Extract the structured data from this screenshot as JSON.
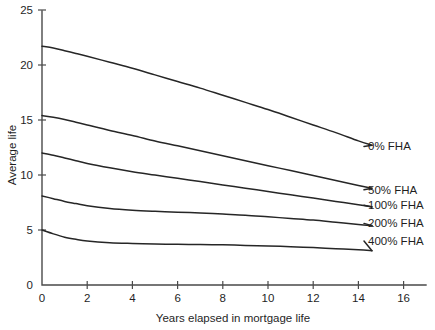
{
  "chart_data": {
    "type": "line",
    "title": "",
    "xlabel": "Years elapsed in mortgage life",
    "ylabel": "Average life",
    "xlim": [
      0,
      17
    ],
    "ylim": [
      0,
      25
    ],
    "xticks": [
      0,
      2,
      4,
      6,
      8,
      10,
      12,
      14,
      16
    ],
    "yticks": [
      0,
      5,
      10,
      15,
      20,
      25
    ],
    "xtick_labels": [
      "0",
      "2",
      "4",
      "6",
      "8",
      "10",
      "12",
      "14",
      "16"
    ],
    "ytick_labels": [
      "0",
      "5",
      "10",
      "15",
      "20",
      "25"
    ],
    "grid": false,
    "legend_position": "right-inline-labels",
    "line_color": "#262626",
    "axis_color": "#4a4a4a",
    "background": "#ffffff",
    "x": [
      0,
      0.5,
      1,
      1.5,
      2,
      3,
      4,
      5,
      6,
      7,
      8,
      9,
      10,
      11,
      12,
      13,
      14,
      14.6
    ],
    "series": [
      {
        "name": "0% FHA",
        "label": "0% FHA",
        "values": [
          21.7,
          21.55,
          21.3,
          21.05,
          20.8,
          20.25,
          19.7,
          19.1,
          18.5,
          17.9,
          17.25,
          16.6,
          15.95,
          15.25,
          14.55,
          13.85,
          13.1,
          12.7
        ],
        "label_y": 12.6
      },
      {
        "name": "50% FHA",
        "label": "50% FHA",
        "values": [
          15.4,
          15.25,
          15.05,
          14.8,
          14.55,
          14.05,
          13.6,
          13.1,
          12.65,
          12.2,
          11.75,
          11.3,
          10.85,
          10.4,
          9.95,
          9.5,
          9.05,
          8.8
        ],
        "label_y": 8.65
      },
      {
        "name": "100% FHA",
        "label": "100% FHA",
        "values": [
          12.0,
          11.8,
          11.55,
          11.3,
          11.05,
          10.65,
          10.3,
          10.0,
          9.7,
          9.4,
          9.1,
          8.8,
          8.5,
          8.2,
          7.9,
          7.6,
          7.3,
          7.1
        ],
        "label_y": 7.25
      },
      {
        "name": "200% FHA",
        "label": "200% FHA",
        "values": [
          8.1,
          7.85,
          7.6,
          7.4,
          7.2,
          6.95,
          6.8,
          6.7,
          6.62,
          6.55,
          6.45,
          6.35,
          6.2,
          6.05,
          5.9,
          5.7,
          5.5,
          5.4
        ],
        "label_y": 5.6
      },
      {
        "name": "400% FHA",
        "label": "400% FHA",
        "values": [
          5.0,
          4.65,
          4.35,
          4.15,
          4.0,
          3.85,
          3.78,
          3.73,
          3.7,
          3.68,
          3.65,
          3.6,
          3.55,
          3.48,
          3.4,
          3.3,
          3.2,
          3.12
        ],
        "label_y": 4.0
      }
    ]
  }
}
